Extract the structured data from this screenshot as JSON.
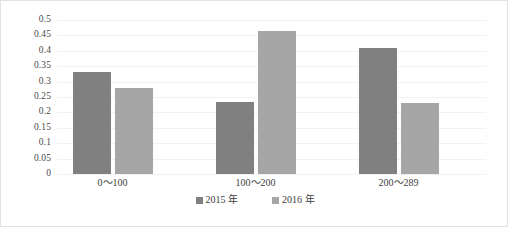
{
  "chart_data": {
    "type": "bar",
    "title": "",
    "subtitle": "",
    "xlabel": "",
    "ylabel": "",
    "categories": [
      "0～100",
      "100～200",
      "200～289"
    ],
    "series": [
      {
        "name": "2015 年",
        "color": "#808080",
        "values": [
          0.33,
          0.235,
          0.41
        ]
      },
      {
        "name": "2016 年",
        "color": "#a6a6a6",
        "values": [
          0.28,
          0.465,
          0.23
        ]
      }
    ],
    "ylim": [
      0,
      0.5
    ],
    "yticks": [
      "0",
      "0.05",
      "0.1",
      "0.15",
      "0.2",
      "0.25",
      "0.3",
      "0.35",
      "0.4",
      "0.45",
      "0.5"
    ],
    "ytick_values": [
      0,
      0.05,
      0.1,
      0.15,
      0.2,
      0.25,
      0.3,
      0.35,
      0.4,
      0.45,
      0.5
    ],
    "grid": true,
    "grid_color": "#f2f2f2",
    "legend_position": "bottom",
    "plot_background": "#ffffff",
    "border_color": "#e2e2e2"
  },
  "legend": {
    "items": [
      {
        "label": "2015 年",
        "swatch": "legend-swatch-2015"
      },
      {
        "label": "2016 年",
        "swatch": "legend-swatch-2016"
      }
    ]
  }
}
